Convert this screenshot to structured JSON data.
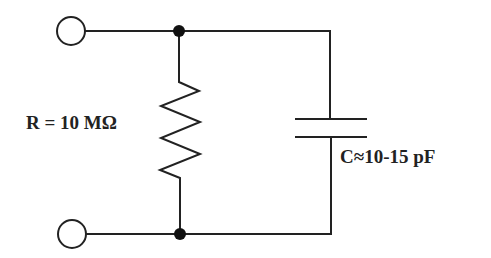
{
  "diagram": {
    "type": "circuit",
    "components": {
      "resistor": {
        "label": "R = 10 MΩ"
      },
      "capacitor": {
        "label": "C≈10-15 pF"
      }
    },
    "terminals": [
      "top-terminal",
      "bottom-terminal"
    ],
    "colors": {
      "line": "#222222",
      "background": "#ffffff"
    }
  }
}
